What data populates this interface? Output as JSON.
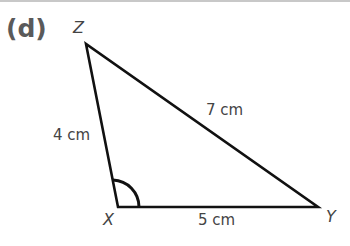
{
  "part_label": "(d)",
  "vertices": {
    "Z": {
      "label": "Z",
      "x": 86,
      "y": 44
    },
    "X": {
      "label": "X",
      "x": 118,
      "y": 207
    },
    "Y": {
      "label": "Y",
      "x": 318,
      "y": 207
    }
  },
  "sides": {
    "XZ": "4 cm",
    "ZY": "7 cm",
    "XY": "5 cm"
  },
  "angle_marked": "X",
  "colors": {
    "line": "#111111",
    "text": "#444444",
    "part": "#5a5a5a"
  }
}
